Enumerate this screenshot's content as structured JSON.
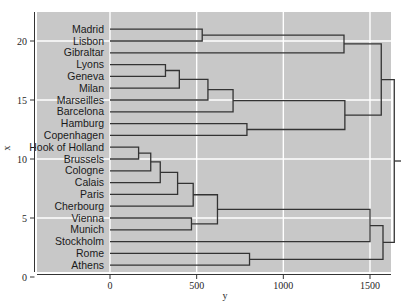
{
  "figure": {
    "background_color": "#ffffff",
    "plot_background_color": "#c8c8c8",
    "grid_color": "#ffffff",
    "line_color": "#333333"
  },
  "axes": {
    "x_axis": {
      "label": "y",
      "ticks": [
        "0",
        "500",
        "1000",
        "1500"
      ],
      "tick_values": [
        0,
        500,
        1000,
        1500
      ],
      "range": [
        -110,
        1680
      ]
    },
    "y_axis": {
      "label": "x",
      "ticks": [
        "0",
        "5",
        "10",
        "15",
        "20"
      ],
      "tick_values": [
        0,
        5,
        10,
        15,
        20
      ],
      "range": [
        -0.4,
        21.8
      ]
    }
  },
  "chart_data": {
    "type": "line",
    "title": "",
    "xlabel": "y",
    "ylabel": "x",
    "xlim": [
      -110,
      1680
    ],
    "ylim": [
      -0.4,
      21.8
    ],
    "grid": true,
    "legend": "none",
    "orientation": "horizontal-dendrogram",
    "leaf_labels": [
      "Madrid",
      "Lisbon",
      "Gibraltar",
      "Lyons",
      "Geneva",
      "Milan",
      "Marseilles",
      "Barcelona",
      "Hamburg",
      "Copenhagen",
      "Hook of Holland",
      "Brussels",
      "Cologne",
      "Calais",
      "Paris",
      "Cherbourg",
      "Vienna",
      "Munich",
      "Stockholm",
      "Rome",
      "Athens"
    ],
    "leaf_positions": [
      21,
      20,
      19,
      18,
      17,
      16,
      15,
      14,
      13,
      12,
      11,
      10,
      9,
      8,
      7,
      6,
      5,
      4,
      3,
      2,
      1
    ],
    "merges": [
      {
        "id": "m1",
        "children": [
          "Madrid",
          "Lisbon"
        ],
        "height": 532,
        "y": 20.5
      },
      {
        "id": "m2",
        "children": [
          "Lyons",
          "Geneva"
        ],
        "height": 320,
        "y": 17.5
      },
      {
        "id": "m3",
        "children": [
          "m2",
          "Milan"
        ],
        "height": 400,
        "y": 16.75
      },
      {
        "id": "m4",
        "children": [
          "m3",
          "Marseilles"
        ],
        "height": 565,
        "y": 15.875
      },
      {
        "id": "m5",
        "children": [
          "m4",
          "Barcelona"
        ],
        "height": 710,
        "y": 14.94
      },
      {
        "id": "m6",
        "children": [
          "Hook of Holland",
          "Brussels"
        ],
        "height": 165,
        "y": 10.5
      },
      {
        "id": "m7",
        "children": [
          "m6",
          "Cologne"
        ],
        "height": 235,
        "y": 9.75
      },
      {
        "id": "m8",
        "children": [
          "m7",
          "Calais"
        ],
        "height": 290,
        "y": 8.875
      },
      {
        "id": "m9",
        "children": [
          "m8",
          "Paris"
        ],
        "height": 390,
        "y": 7.94
      },
      {
        "id": "m10",
        "children": [
          "m9",
          "Cherbourg"
        ],
        "height": 480,
        "y": 6.97
      },
      {
        "id": "m11",
        "children": [
          "Vienna",
          "Munich"
        ],
        "height": 470,
        "y": 4.5
      },
      {
        "id": "m12",
        "children": [
          "m10",
          "m11"
        ],
        "height": 620,
        "y": 5.73
      },
      {
        "id": "m13",
        "children": [
          "Hamburg",
          "Copenhagen"
        ],
        "height": 790,
        "y": 12.5
      },
      {
        "id": "m14",
        "children": [
          "m5",
          "m13"
        ],
        "height": 1355,
        "y": 13.72
      },
      {
        "id": "m15",
        "children": [
          "m1",
          "Gibraltar"
        ],
        "height": 1350,
        "y": 19.75
      },
      {
        "id": "m16",
        "children": [
          "m14",
          "m15"
        ],
        "height": 1565,
        "y": 16.73
      },
      {
        "id": "m17",
        "children": [
          "Rome",
          "Athens"
        ],
        "height": 805,
        "y": 1.5
      },
      {
        "id": "m18",
        "children": [
          "m12",
          "Stockholm"
        ],
        "height": 1500,
        "y": 4.36
      },
      {
        "id": "m19",
        "children": [
          "m18",
          "m17"
        ],
        "height": 1575,
        "y": 2.93
      },
      {
        "id": "m20",
        "children": [
          "m16",
          "m19"
        ],
        "height": 1640,
        "y": 9.83
      }
    ]
  }
}
